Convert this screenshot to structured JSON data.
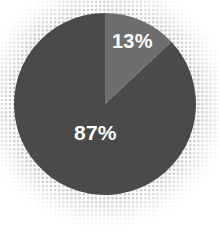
{
  "chart_data": {
    "type": "pie",
    "title": "",
    "categories": [
      "Majority share",
      "Minority share"
    ],
    "values": [
      87,
      13
    ],
    "labels": [
      "87%",
      "13%"
    ],
    "colors": [
      "#4a4a4a",
      "#6e6e6e"
    ],
    "label_color": "#ffffff",
    "units": "percent",
    "total": 100,
    "legend": "none",
    "grid": false,
    "start_angle_deg": 0,
    "direction": "clockwise",
    "background": "#ffffff",
    "halftone_dot_color": "#b9b9b9",
    "slices": [
      {
        "name": "Majority share",
        "label": "87%",
        "value": 87,
        "color": "#4a4a4a",
        "start_angle_deg": 46.8,
        "end_angle_deg": 360
      },
      {
        "name": "Minority share",
        "label": "13%",
        "value": 13,
        "color": "#6e6e6e",
        "start_angle_deg": 0,
        "end_angle_deg": 46.8
      }
    ]
  },
  "chart": {
    "minor_slice_label": "13%",
    "major_slice_label": "87%"
  }
}
